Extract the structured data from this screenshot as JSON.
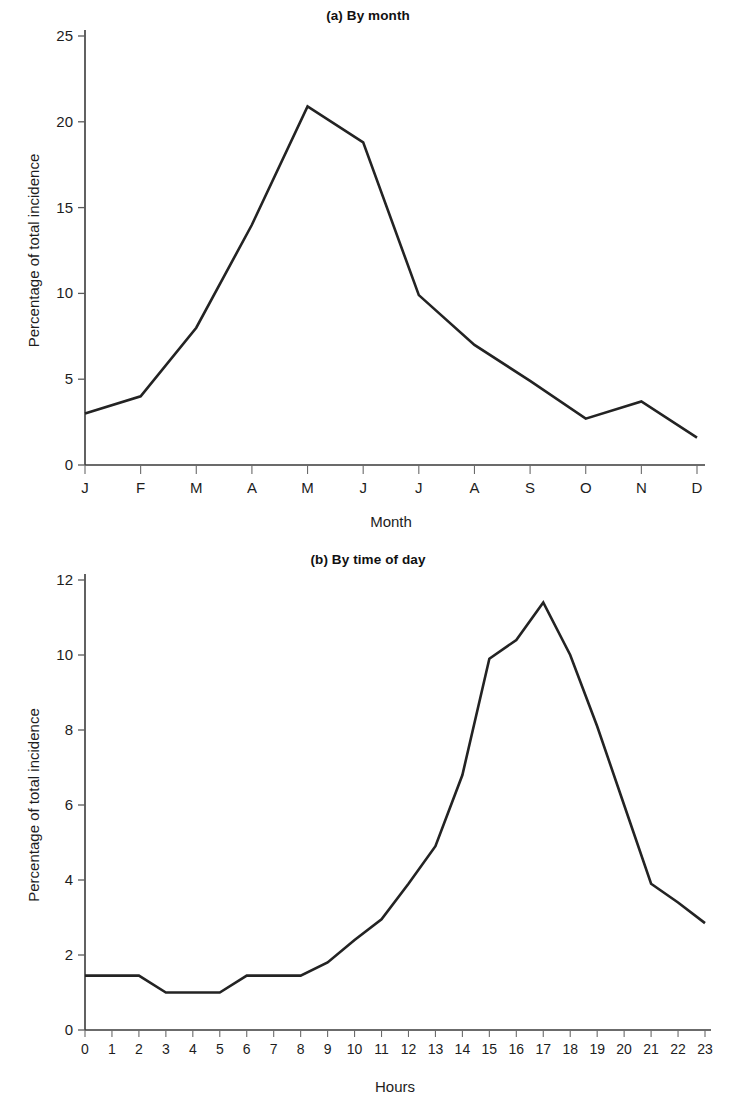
{
  "figures": [
    {
      "id": "a",
      "title": "(a) By month",
      "xlabel": "Month",
      "ylabel": "Percentage of total incidence"
    },
    {
      "id": "b",
      "title": "(b) By time of day",
      "xlabel": "Hours",
      "ylabel": "Percentage of total incidence"
    }
  ],
  "chart_data": [
    {
      "type": "line",
      "title": "(a) By month",
      "xlabel": "Month",
      "ylabel": "Percentage of total incidence",
      "categories": [
        "J",
        "F",
        "M",
        "A",
        "M",
        "J",
        "J",
        "A",
        "S",
        "O",
        "N",
        "D"
      ],
      "category_names": [
        "January",
        "February",
        "March",
        "April",
        "May",
        "June",
        "July",
        "August",
        "September",
        "October",
        "November",
        "December"
      ],
      "values": [
        3.0,
        4.0,
        8.0,
        14.0,
        20.9,
        18.8,
        9.9,
        7.0,
        4.9,
        2.7,
        3.7,
        1.6
      ],
      "ylim": [
        0,
        25
      ],
      "yticks": [
        0,
        5,
        10,
        15,
        20,
        25
      ],
      "ytick_labels": [
        "0",
        "5",
        "10",
        "15",
        "20",
        "25"
      ],
      "xtick_labels": [
        "J",
        "F",
        "M",
        "A",
        "M",
        "J",
        "J",
        "A",
        "S",
        "O",
        "N",
        "D"
      ],
      "grid": false,
      "legend": false,
      "line_color": "#232323"
    },
    {
      "type": "line",
      "title": "(b) By time of day",
      "xlabel": "Hours",
      "ylabel": "Percentage of total incidence",
      "x": [
        0,
        1,
        2,
        3,
        4,
        5,
        6,
        7,
        8,
        9,
        10,
        11,
        12,
        13,
        14,
        15,
        16,
        17,
        18,
        19,
        20,
        21,
        22,
        23
      ],
      "values": [
        1.45,
        1.45,
        1.45,
        1.0,
        1.0,
        1.0,
        1.45,
        1.45,
        1.45,
        1.8,
        2.4,
        2.95,
        3.9,
        4.9,
        6.8,
        9.9,
        10.4,
        11.4,
        10.0,
        8.1,
        6.0,
        3.9,
        3.4,
        2.85
      ],
      "ylim": [
        0,
        12
      ],
      "yticks": [
        0,
        2,
        4,
        6,
        8,
        10,
        12
      ],
      "ytick_labels": [
        "0",
        "2",
        "4",
        "6",
        "8",
        "10",
        "12"
      ],
      "xtick_labels": [
        "0",
        "1",
        "2",
        "3",
        "4",
        "5",
        "6",
        "7",
        "8",
        "9",
        "10",
        "11",
        "12",
        "13",
        "14",
        "15",
        "16",
        "17",
        "18",
        "19",
        "20",
        "21",
        "22",
        "23"
      ],
      "grid": false,
      "legend": false,
      "line_color": "#232323"
    }
  ]
}
